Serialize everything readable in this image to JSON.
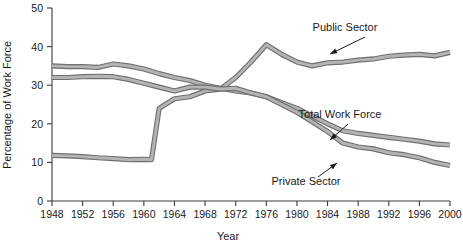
{
  "chart_data": {
    "type": "line",
    "title": "",
    "xlabel": "Year",
    "ylabel": "Percentage of Work Force",
    "xlim": [
      1948,
      2000
    ],
    "ylim": [
      0,
      50
    ],
    "grid": false,
    "legend_position": "inline-annotations",
    "xticks": [
      1948,
      1952,
      1956,
      1960,
      1964,
      1968,
      1972,
      1976,
      1980,
      1984,
      1988,
      1992,
      1996,
      2000
    ],
    "yticks": [
      0,
      10,
      20,
      30,
      40,
      50
    ],
    "annotations": [
      "Public Sector",
      "Total Work Force",
      "Private Sector"
    ],
    "series": [
      {
        "name": "Public Sector",
        "x": [
          1948,
          1950,
          1952,
          1954,
          1956,
          1958,
          1960,
          1961,
          1962,
          1964,
          1966,
          1968,
          1970,
          1972,
          1974,
          1976,
          1978,
          1980,
          1982,
          1984,
          1986,
          1988,
          1990,
          1992,
          1994,
          1996,
          1998,
          2000
        ],
        "values": [
          11.8,
          11.7,
          11.5,
          11.2,
          11.0,
          10.7,
          10.8,
          10.7,
          24.0,
          26.5,
          27.0,
          28.5,
          29.0,
          32.0,
          36.0,
          40.5,
          38.0,
          36.0,
          35.0,
          35.8,
          36.0,
          36.5,
          36.8,
          37.5,
          37.8,
          38.0,
          37.6,
          38.5
        ]
      },
      {
        "name": "Total Work Force",
        "x": [
          1948,
          1950,
          1952,
          1954,
          1956,
          1958,
          1960,
          1962,
          1964,
          1966,
          1968,
          1970,
          1972,
          1974,
          1976,
          1978,
          1980,
          1982,
          1984,
          1986,
          1988,
          1990,
          1992,
          1994,
          1996,
          1998,
          2000
        ],
        "values": [
          35.0,
          34.8,
          34.8,
          34.6,
          35.5,
          35.0,
          34.2,
          33.0,
          32.0,
          31.2,
          30.0,
          29.2,
          28.5,
          28.0,
          27.0,
          25.5,
          24.0,
          22.0,
          20.0,
          18.2,
          17.5,
          17.0,
          16.5,
          16.0,
          15.5,
          14.8,
          14.5
        ]
      },
      {
        "name": "Private Sector",
        "x": [
          1948,
          1950,
          1952,
          1954,
          1956,
          1958,
          1960,
          1962,
          1964,
          1966,
          1968,
          1970,
          1972,
          1974,
          1976,
          1978,
          1980,
          1982,
          1984,
          1986,
          1988,
          1990,
          1992,
          1994,
          1996,
          1998,
          2000
        ],
        "values": [
          32.0,
          32.0,
          32.2,
          32.3,
          32.2,
          31.5,
          30.5,
          29.5,
          28.5,
          29.5,
          29.5,
          29.0,
          29.2,
          28.0,
          27.0,
          25.0,
          23.0,
          20.5,
          18.0,
          15.0,
          14.0,
          13.5,
          12.5,
          12.0,
          11.2,
          10.0,
          9.2
        ]
      }
    ],
    "colors": {
      "line_outline": "#6f6f6f",
      "line_fill": "#b4b4b4",
      "axis": "#3a3a3a",
      "text": "#1a1a1a",
      "background": "#ffffff"
    }
  }
}
